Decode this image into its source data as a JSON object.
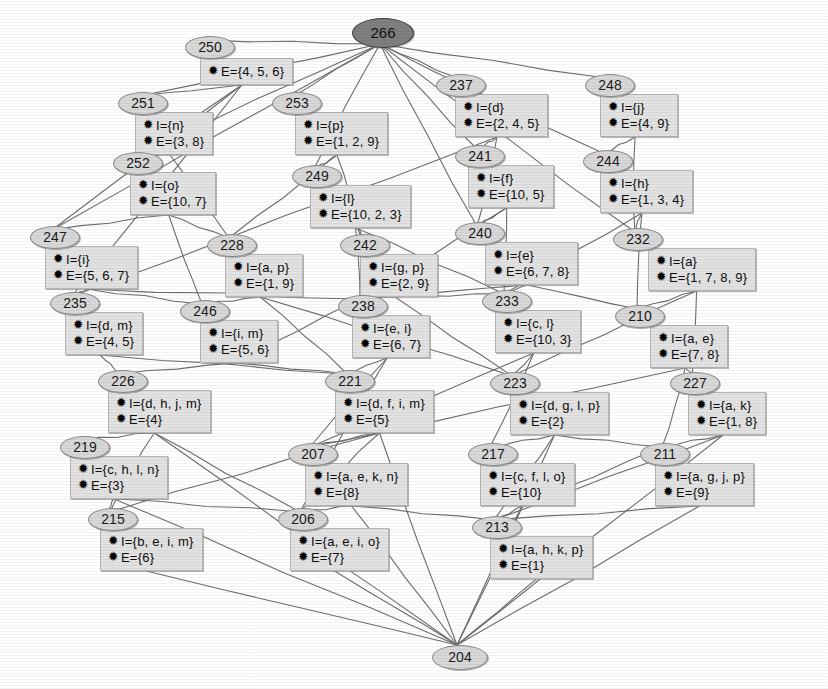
{
  "diagram": {
    "bullet_glyph": "✹",
    "intent_prefix": "I=",
    "extent_prefix": "E=",
    "colors": {
      "box_fill": "#e2e2e2",
      "box_border": "#b6b6b6",
      "badge_fill": "#d8d8d8",
      "badge_border": "#8a8a8a",
      "top_badge_fill": "#7f7f7f",
      "edge": "#6e6e6e",
      "background": "#ffffff"
    },
    "top_node": {
      "id": "266",
      "x": 352,
      "y": 18
    },
    "bottom_node": {
      "id": "204",
      "x": 432,
      "y": 645
    },
    "nodes": [
      {
        "id": "250",
        "x": 185,
        "y": 36,
        "bx": 200,
        "by": 58,
        "intent": "",
        "extent": "E={4, 5, 6}",
        "has_intent": false
      },
      {
        "id": "251",
        "x": 118,
        "y": 92,
        "bx": 135,
        "by": 112,
        "intent": "I={n}",
        "extent": "E={3, 8}",
        "has_intent": true
      },
      {
        "id": "253",
        "x": 272,
        "y": 92,
        "bx": 295,
        "by": 112,
        "intent": "I={p}",
        "extent": "E={1, 2, 9}",
        "has_intent": true
      },
      {
        "id": "237",
        "x": 436,
        "y": 74,
        "bx": 455,
        "by": 94,
        "intent": "I={d}",
        "extent": "E={2, 4, 5}",
        "has_intent": true
      },
      {
        "id": "248",
        "x": 585,
        "y": 74,
        "bx": 600,
        "by": 94,
        "intent": "I={j}",
        "extent": "E={4, 9}",
        "has_intent": true
      },
      {
        "id": "252",
        "x": 113,
        "y": 152,
        "bx": 130,
        "by": 172,
        "intent": "I={o}",
        "extent": "E={10, 7}",
        "has_intent": true
      },
      {
        "id": "249",
        "x": 292,
        "y": 165,
        "bx": 310,
        "by": 185,
        "intent": "I={l}",
        "extent": "E={10, 2, 3}",
        "has_intent": true
      },
      {
        "id": "241",
        "x": 455,
        "y": 145,
        "bx": 468,
        "by": 165,
        "intent": "I={f}",
        "extent": "E={10, 5}",
        "has_intent": true
      },
      {
        "id": "244",
        "x": 583,
        "y": 150,
        "bx": 600,
        "by": 170,
        "intent": "I={h}",
        "extent": "E={1, 3, 4}",
        "has_intent": true
      },
      {
        "id": "247",
        "x": 30,
        "y": 226,
        "bx": 45,
        "by": 246,
        "intent": "I={i}",
        "extent": "E={5, 6, 7}",
        "has_intent": true
      },
      {
        "id": "228",
        "x": 207,
        "y": 234,
        "bx": 225,
        "by": 254,
        "intent": "I={a, p}",
        "extent": "E={1, 9}",
        "has_intent": true
      },
      {
        "id": "242",
        "x": 340,
        "y": 234,
        "bx": 360,
        "by": 254,
        "intent": "I={g, p}",
        "extent": "E={2, 9}",
        "has_intent": true
      },
      {
        "id": "240",
        "x": 455,
        "y": 222,
        "bx": 485,
        "by": 242,
        "intent": "I={e}",
        "extent": "E={6, 7, 8}",
        "has_intent": true
      },
      {
        "id": "232",
        "x": 613,
        "y": 228,
        "bx": 648,
        "by": 248,
        "intent": "I={a}",
        "extent": "E={1, 7, 8, 9}",
        "has_intent": true
      },
      {
        "id": "235",
        "x": 50,
        "y": 292,
        "bx": 65,
        "by": 312,
        "intent": "I={d, m}",
        "extent": "E={4, 5}",
        "has_intent": true
      },
      {
        "id": "246",
        "x": 180,
        "y": 300,
        "bx": 200,
        "by": 320,
        "intent": "I={i, m}",
        "extent": "E={5, 6}",
        "has_intent": true
      },
      {
        "id": "238",
        "x": 338,
        "y": 295,
        "bx": 352,
        "by": 315,
        "intent": "I={e, i}",
        "extent": "E={6, 7}",
        "has_intent": true
      },
      {
        "id": "233",
        "x": 482,
        "y": 290,
        "bx": 495,
        "by": 310,
        "intent": "I={c, l}",
        "extent": "E={10, 3}",
        "has_intent": true
      },
      {
        "id": "210",
        "x": 615,
        "y": 305,
        "bx": 650,
        "by": 325,
        "intent": "I={a, e}",
        "extent": "E={7, 8}",
        "has_intent": true
      },
      {
        "id": "226",
        "x": 98,
        "y": 370,
        "bx": 108,
        "by": 390,
        "intent": "I={d, h, j, m}",
        "extent": "E={4}",
        "has_intent": true
      },
      {
        "id": "221",
        "x": 325,
        "y": 370,
        "bx": 335,
        "by": 390,
        "intent": "I={d, f, i, m}",
        "extent": "E={5}",
        "has_intent": true
      },
      {
        "id": "223",
        "x": 490,
        "y": 372,
        "bx": 510,
        "by": 392,
        "intent": "I={d, g, l, p}",
        "extent": "E={2}",
        "has_intent": true
      },
      {
        "id": "227",
        "x": 670,
        "y": 372,
        "bx": 688,
        "by": 392,
        "intent": "I={a, k}",
        "extent": "E={1, 8}",
        "has_intent": true
      },
      {
        "id": "219",
        "x": 60,
        "y": 436,
        "bx": 70,
        "by": 456,
        "intent": "I={c, h, l, n}",
        "extent": "E={3}",
        "has_intent": true
      },
      {
        "id": "207",
        "x": 288,
        "y": 443,
        "bx": 305,
        "by": 463,
        "intent": "I={a, e, k, n}",
        "extent": "E={8}",
        "has_intent": true
      },
      {
        "id": "217",
        "x": 468,
        "y": 443,
        "bx": 480,
        "by": 463,
        "intent": "I={c, f, l, o}",
        "extent": "E={10}",
        "has_intent": true
      },
      {
        "id": "211",
        "x": 640,
        "y": 443,
        "bx": 655,
        "by": 463,
        "intent": "I={a, g, j, p}",
        "extent": "E={9}",
        "has_intent": true
      },
      {
        "id": "215",
        "x": 88,
        "y": 508,
        "bx": 100,
        "by": 528,
        "intent": "I={b, e, i, m}",
        "extent": "E={6}",
        "has_intent": true
      },
      {
        "id": "206",
        "x": 278,
        "y": 508,
        "bx": 290,
        "by": 528,
        "intent": "I={a, e, i, o}",
        "extent": "E={7}",
        "has_intent": true
      },
      {
        "id": "213",
        "x": 472,
        "y": 516,
        "bx": 490,
        "by": 536,
        "intent": "I={a, h, k, p}",
        "extent": "E={1}",
        "has_intent": true
      }
    ],
    "edges": [
      [
        "266",
        "250"
      ],
      [
        "266",
        "251"
      ],
      [
        "266",
        "253"
      ],
      [
        "266",
        "237"
      ],
      [
        "266",
        "248"
      ],
      [
        "266",
        "241"
      ],
      [
        "266",
        "244"
      ],
      [
        "266",
        "249"
      ],
      [
        "266",
        "252"
      ],
      [
        "266",
        "240"
      ],
      [
        "266",
        "232"
      ],
      [
        "266",
        "247"
      ],
      [
        "250",
        "251"
      ],
      [
        "250",
        "252"
      ],
      [
        "250",
        "235"
      ],
      [
        "250",
        "247"
      ],
      [
        "251",
        "252"
      ],
      [
        "251",
        "228"
      ],
      [
        "253",
        "249"
      ],
      [
        "253",
        "228"
      ],
      [
        "253",
        "242"
      ],
      [
        "237",
        "241"
      ],
      [
        "237",
        "240"
      ],
      [
        "237",
        "235"
      ],
      [
        "248",
        "244"
      ],
      [
        "248",
        "232"
      ],
      [
        "252",
        "247"
      ],
      [
        "252",
        "228"
      ],
      [
        "252",
        "246"
      ],
      [
        "249",
        "242"
      ],
      [
        "249",
        "233"
      ],
      [
        "249",
        "238"
      ],
      [
        "241",
        "240"
      ],
      [
        "241",
        "233"
      ],
      [
        "241",
        "238"
      ],
      [
        "244",
        "232"
      ],
      [
        "244",
        "210"
      ],
      [
        "244",
        "233"
      ],
      [
        "247",
        "235"
      ],
      [
        "247",
        "246"
      ],
      [
        "247",
        "238"
      ],
      [
        "228",
        "246"
      ],
      [
        "228",
        "221"
      ],
      [
        "228",
        "223"
      ],
      [
        "242",
        "238"
      ],
      [
        "242",
        "223"
      ],
      [
        "242",
        "233"
      ],
      [
        "240",
        "238"
      ],
      [
        "240",
        "210"
      ],
      [
        "240",
        "233"
      ],
      [
        "232",
        "210"
      ],
      [
        "232",
        "227"
      ],
      [
        "232",
        "223"
      ],
      [
        "235",
        "226"
      ],
      [
        "235",
        "221"
      ],
      [
        "246",
        "226"
      ],
      [
        "246",
        "221"
      ],
      [
        "246",
        "238"
      ],
      [
        "238",
        "221"
      ],
      [
        "238",
        "207"
      ],
      [
        "238",
        "206"
      ],
      [
        "233",
        "223"
      ],
      [
        "233",
        "217"
      ],
      [
        "233",
        "207"
      ],
      [
        "210",
        "227"
      ],
      [
        "210",
        "207"
      ],
      [
        "210",
        "211"
      ],
      [
        "226",
        "219"
      ],
      [
        "226",
        "206"
      ],
      [
        "226",
        "215"
      ],
      [
        "221",
        "207"
      ],
      [
        "221",
        "206"
      ],
      [
        "221",
        "215"
      ],
      [
        "223",
        "217"
      ],
      [
        "223",
        "211"
      ],
      [
        "223",
        "213"
      ],
      [
        "227",
        "211"
      ],
      [
        "227",
        "213"
      ],
      [
        "219",
        "215"
      ],
      [
        "219",
        "206"
      ],
      [
        "207",
        "206"
      ],
      [
        "207",
        "213"
      ],
      [
        "217",
        "213"
      ],
      [
        "217",
        "211"
      ],
      [
        "211",
        "213"
      ],
      [
        "215",
        "204"
      ],
      [
        "206",
        "204"
      ],
      [
        "213",
        "204"
      ],
      [
        "219",
        "204"
      ],
      [
        "207",
        "204"
      ],
      [
        "217",
        "204"
      ],
      [
        "226",
        "204"
      ],
      [
        "221",
        "204"
      ],
      [
        "223",
        "204"
      ],
      [
        "227",
        "204"
      ],
      [
        "211",
        "204"
      ]
    ]
  }
}
